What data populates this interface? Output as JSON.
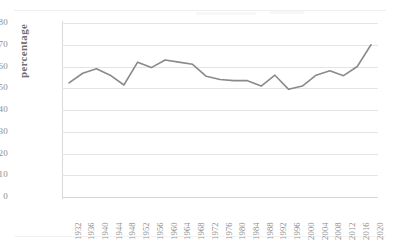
{
  "chart_data": {
    "type": "line",
    "title": "",
    "xlabel": "",
    "ylabel": "percentage",
    "ylim": [
      0,
      80
    ],
    "ytick_step": 10,
    "yticks": [
      80,
      70,
      60,
      50,
      40,
      30,
      20,
      10,
      0
    ],
    "grid": true,
    "legend": "none",
    "line_color": "#808080",
    "categories": [
      "1932",
      "1936",
      "1940",
      "1944",
      "1948",
      "1952",
      "1956",
      "1960",
      "1964",
      "1968",
      "1972",
      "1976",
      "1980",
      "1984",
      "1988",
      "1992",
      "1996",
      "2000",
      "2004",
      "2008",
      "2012",
      "2016",
      "2020"
    ],
    "values": [
      52.5,
      56.9,
      59.0,
      56.0,
      51.5,
      62.0,
      59.5,
      63.0,
      62.0,
      61.0,
      55.5,
      54.0,
      53.5,
      53.5,
      51.0,
      56.0,
      49.5,
      51.0,
      56.0,
      58.0,
      55.8,
      60.0,
      70.0
    ],
    "series": [
      {
        "name": "percentage",
        "values": [
          52.5,
          56.9,
          59.0,
          56.0,
          51.5,
          62.0,
          59.5,
          63.0,
          62.0,
          61.0,
          55.5,
          54.0,
          53.5,
          53.5,
          51.0,
          56.0,
          49.5,
          51.0,
          56.0,
          58.0,
          55.8,
          60.0,
          70.0
        ]
      }
    ]
  },
  "axis": {
    "y_title": "percentage"
  }
}
